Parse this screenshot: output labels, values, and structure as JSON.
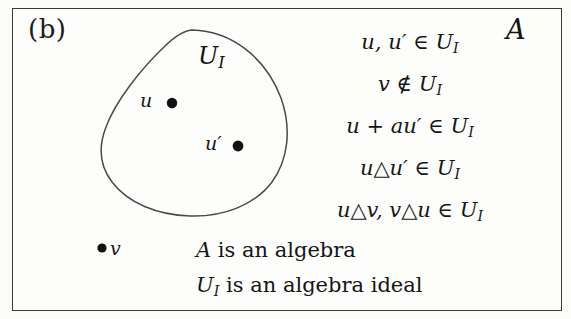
{
  "figure": {
    "panel_label": "(b)",
    "algebra_symbol": "A",
    "background_color": "#fbfbfa",
    "frame_color": "#3a3a3a",
    "ink_color": "#151515"
  },
  "region": {
    "name": "ideal-blob",
    "label": "U",
    "label_subscript": "I",
    "shape": "closed teardrop curve",
    "stroke_color": "#4a4a4a"
  },
  "points": [
    {
      "name": "u",
      "label": "u",
      "inside_region": true,
      "x": 172,
      "y": 103
    },
    {
      "name": "u-prime",
      "label": "u′",
      "inside_region": true,
      "x": 238,
      "y": 146
    },
    {
      "name": "v",
      "label": "v",
      "inside_region": false,
      "x": 102,
      "y": 248
    }
  ],
  "equations": [
    {
      "id": "eq-1",
      "text": "u, u′ ∈ 𝒰₁",
      "lhs": "u, u′",
      "relation": "∈",
      "rhs": "U_I"
    },
    {
      "id": "eq-2",
      "text": "v ∉ 𝒰₁",
      "lhs": "v",
      "relation": "∉",
      "rhs": "U_I"
    },
    {
      "id": "eq-3",
      "text": "u + au′ ∈ 𝒰₁",
      "lhs": "u + au′",
      "relation": "∈",
      "rhs": "U_I"
    },
    {
      "id": "eq-4",
      "text": "u△u′ ∈ 𝒰₁",
      "lhs": "u△u′",
      "relation": "∈",
      "rhs": "U_I"
    },
    {
      "id": "eq-5",
      "text": "u△v, v△u ∈ 𝒰₁",
      "lhs": "u△v, v△u",
      "relation": "∈",
      "rhs": "U_I"
    }
  ],
  "statements": [
    {
      "id": "stmt-1",
      "subject": "A",
      "text": "is an algebra"
    },
    {
      "id": "stmt-2",
      "subject": "U",
      "subscript": "I",
      "text": "is an algebra ideal"
    }
  ]
}
